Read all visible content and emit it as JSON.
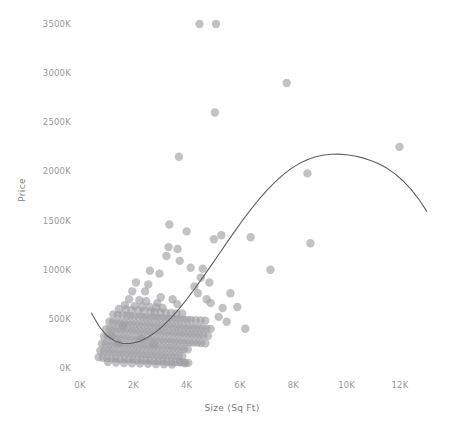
{
  "chart_data": {
    "type": "scatter",
    "title": "",
    "xlabel": "Size (Sq Ft)",
    "ylabel": "Price",
    "grid": false,
    "legend": false,
    "legend_position": "none",
    "xlim": [
      0,
      13000
    ],
    "ylim": [
      0,
      3650
    ],
    "x_ticks": [
      0,
      2000,
      4000,
      6000,
      8000,
      10000,
      12000
    ],
    "x_tick_labels": [
      "0K",
      "2K",
      "4K",
      "6K",
      "8K",
      "10K",
      "12K"
    ],
    "y_ticks": [
      0,
      500,
      1000,
      1500,
      2000,
      2500,
      3000,
      3500
    ],
    "y_tick_labels": [
      "0K",
      "500K",
      "1000K",
      "1500K",
      "2000K",
      "2500K",
      "3000K",
      "3500K"
    ],
    "y_units": "thousands",
    "marker": {
      "shape": "circle",
      "radius_px": 4.2,
      "color": "#9c9ca2",
      "opacity": 0.62
    },
    "trendline": {
      "present": true,
      "color": "#5f5f63",
      "width_px": 1.1,
      "style": "solid",
      "shape": "cubic-polynomial",
      "points": [
        [
          430,
          560
        ],
        [
          700,
          430
        ],
        [
          1000,
          330
        ],
        [
          1300,
          275
        ],
        [
          1600,
          250
        ],
        [
          1900,
          250
        ],
        [
          2200,
          268
        ],
        [
          2500,
          305
        ],
        [
          2800,
          358
        ],
        [
          3100,
          425
        ],
        [
          3400,
          505
        ],
        [
          3700,
          597
        ],
        [
          4000,
          698
        ],
        [
          4300,
          806
        ],
        [
          4600,
          920
        ],
        [
          4900,
          1037
        ],
        [
          5200,
          1155
        ],
        [
          5500,
          1273
        ],
        [
          5800,
          1390
        ],
        [
          6100,
          1503
        ],
        [
          6400,
          1611
        ],
        [
          6700,
          1712
        ],
        [
          7000,
          1805
        ],
        [
          7300,
          1889
        ],
        [
          7600,
          1963
        ],
        [
          7900,
          2026
        ],
        [
          8200,
          2077
        ],
        [
          8500,
          2117
        ],
        [
          8800,
          2146
        ],
        [
          9100,
          2165
        ],
        [
          9400,
          2175
        ],
        [
          9700,
          2176
        ],
        [
          10000,
          2170
        ],
        [
          10300,
          2157
        ],
        [
          10600,
          2138
        ],
        [
          10900,
          2112
        ],
        [
          11200,
          2078
        ],
        [
          11500,
          2034
        ],
        [
          11800,
          1978
        ],
        [
          12100,
          1908
        ],
        [
          12400,
          1822
        ],
        [
          12700,
          1719
        ],
        [
          13000,
          1596
        ]
      ]
    },
    "series": [
      {
        "name": "Homes",
        "points": [
          [
            4480,
            3500
          ],
          [
            5100,
            3500
          ],
          [
            7750,
            2900
          ],
          [
            5060,
            2600
          ],
          [
            3710,
            2150
          ],
          [
            8530,
            1980
          ],
          [
            11980,
            2250
          ],
          [
            8640,
            1270
          ],
          [
            3350,
            1460
          ],
          [
            4000,
            1390
          ],
          [
            5300,
            1350
          ],
          [
            3320,
            1230
          ],
          [
            3660,
            1210
          ],
          [
            3240,
            1140
          ],
          [
            3740,
            1090
          ],
          [
            7140,
            1000
          ],
          [
            4530,
            920
          ],
          [
            4850,
            870
          ],
          [
            4290,
            830
          ],
          [
            2100,
            870
          ],
          [
            2560,
            850
          ],
          [
            1960,
            780
          ],
          [
            5640,
            760
          ],
          [
            1840,
            700
          ],
          [
            2230,
            690
          ],
          [
            2480,
            680
          ],
          [
            3030,
            720
          ],
          [
            3470,
            700
          ],
          [
            2900,
            660
          ],
          [
            3650,
            650
          ],
          [
            1680,
            640
          ],
          [
            2050,
            630
          ],
          [
            2340,
            625
          ],
          [
            2620,
            620
          ],
          [
            2870,
            615
          ],
          [
            3100,
            610
          ],
          [
            1460,
            600
          ],
          [
            1720,
            595
          ],
          [
            1930,
            590
          ],
          [
            2180,
            585
          ],
          [
            2400,
            580
          ],
          [
            2650,
            575
          ],
          [
            2810,
            570
          ],
          [
            3010,
            565
          ],
          [
            3220,
            560
          ],
          [
            3420,
            560
          ],
          [
            3620,
            555
          ],
          [
            3830,
            555
          ],
          [
            1250,
            545
          ],
          [
            1420,
            540
          ],
          [
            1590,
            535
          ],
          [
            1760,
            530
          ],
          [
            1890,
            528
          ],
          [
            2040,
            525
          ],
          [
            2190,
            520
          ],
          [
            2330,
            518
          ],
          [
            2470,
            515
          ],
          [
            2610,
            512
          ],
          [
            2750,
            510
          ],
          [
            2890,
            508
          ],
          [
            3030,
            505
          ],
          [
            3180,
            503
          ],
          [
            3320,
            500
          ],
          [
            3460,
            498
          ],
          [
            3600,
            496
          ],
          [
            3740,
            494
          ],
          [
            3880,
            492
          ],
          [
            4020,
            490
          ],
          [
            4160,
            488
          ],
          [
            4340,
            486
          ],
          [
            4520,
            484
          ],
          [
            4700,
            482
          ],
          [
            1100,
            470
          ],
          [
            1240,
            465
          ],
          [
            1380,
            462
          ],
          [
            1520,
            458
          ],
          [
            1660,
            455
          ],
          [
            1800,
            452
          ],
          [
            1940,
            450
          ],
          [
            2080,
            447
          ],
          [
            2220,
            444
          ],
          [
            2360,
            442
          ],
          [
            2500,
            440
          ],
          [
            2640,
            437
          ],
          [
            2780,
            434
          ],
          [
            2920,
            432
          ],
          [
            3060,
            430
          ],
          [
            3200,
            428
          ],
          [
            3340,
            425
          ],
          [
            3480,
            422
          ],
          [
            3620,
            420
          ],
          [
            3760,
            418
          ],
          [
            3900,
            415
          ],
          [
            4040,
            412
          ],
          [
            4180,
            410
          ],
          [
            4320,
            408
          ],
          [
            4460,
            405
          ],
          [
            4600,
            402
          ],
          [
            4740,
            400
          ],
          [
            4900,
            398
          ],
          [
            980,
            395
          ],
          [
            1120,
            392
          ],
          [
            1260,
            390
          ],
          [
            1400,
            388
          ],
          [
            1540,
            385
          ],
          [
            1680,
            382
          ],
          [
            1820,
            380
          ],
          [
            1960,
            378
          ],
          [
            2100,
            375
          ],
          [
            2240,
            372
          ],
          [
            2380,
            370
          ],
          [
            2520,
            368
          ],
          [
            2660,
            365
          ],
          [
            2800,
            362
          ],
          [
            2940,
            360
          ],
          [
            3080,
            358
          ],
          [
            3220,
            355
          ],
          [
            3360,
            352
          ],
          [
            3500,
            350
          ],
          [
            3640,
            348
          ],
          [
            3780,
            345
          ],
          [
            3920,
            342
          ],
          [
            4060,
            340
          ],
          [
            4200,
            338
          ],
          [
            4340,
            335
          ],
          [
            4480,
            332
          ],
          [
            4620,
            330
          ],
          [
            4800,
            328
          ],
          [
            900,
            320
          ],
          [
            1040,
            318
          ],
          [
            1180,
            315
          ],
          [
            1320,
            312
          ],
          [
            1460,
            310
          ],
          [
            1600,
            308
          ],
          [
            1740,
            305
          ],
          [
            1880,
            302
          ],
          [
            2020,
            300
          ],
          [
            2160,
            298
          ],
          [
            2300,
            295
          ],
          [
            2440,
            292
          ],
          [
            2580,
            290
          ],
          [
            2720,
            288
          ],
          [
            2860,
            285
          ],
          [
            3000,
            282
          ],
          [
            3140,
            280
          ],
          [
            3280,
            278
          ],
          [
            3420,
            275
          ],
          [
            3560,
            272
          ],
          [
            3700,
            270
          ],
          [
            3840,
            268
          ],
          [
            3980,
            265
          ],
          [
            4120,
            262
          ],
          [
            4260,
            260
          ],
          [
            4400,
            258
          ],
          [
            4540,
            255
          ],
          [
            4700,
            252
          ],
          [
            820,
            248
          ],
          [
            960,
            245
          ],
          [
            1100,
            242
          ],
          [
            1240,
            240
          ],
          [
            1380,
            238
          ],
          [
            1520,
            235
          ],
          [
            1660,
            232
          ],
          [
            1800,
            230
          ],
          [
            1940,
            228
          ],
          [
            2080,
            225
          ],
          [
            2220,
            222
          ],
          [
            2360,
            220
          ],
          [
            2500,
            218
          ],
          [
            2640,
            215
          ],
          [
            2780,
            212
          ],
          [
            2920,
            210
          ],
          [
            3060,
            208
          ],
          [
            3200,
            205
          ],
          [
            3340,
            202
          ],
          [
            3480,
            200
          ],
          [
            3620,
            198
          ],
          [
            3760,
            195
          ],
          [
            3900,
            192
          ],
          [
            4040,
            190
          ],
          [
            760,
            175
          ],
          [
            900,
            172
          ],
          [
            1040,
            170
          ],
          [
            1180,
            168
          ],
          [
            1320,
            165
          ],
          [
            1460,
            162
          ],
          [
            1600,
            160
          ],
          [
            1740,
            158
          ],
          [
            1880,
            155
          ],
          [
            2020,
            152
          ],
          [
            2160,
            150
          ],
          [
            2300,
            148
          ],
          [
            2440,
            145
          ],
          [
            2580,
            142
          ],
          [
            2720,
            140
          ],
          [
            2860,
            138
          ],
          [
            3000,
            135
          ],
          [
            3140,
            132
          ],
          [
            3280,
            130
          ],
          [
            3420,
            128
          ],
          [
            3560,
            125
          ],
          [
            3700,
            122
          ],
          [
            3840,
            120
          ],
          [
            700,
            110
          ],
          [
            860,
            105
          ],
          [
            1020,
            100
          ],
          [
            1180,
            98
          ],
          [
            1340,
            95
          ],
          [
            1500,
            92
          ],
          [
            1660,
            90
          ],
          [
            1820,
            88
          ],
          [
            1980,
            85
          ],
          [
            2140,
            82
          ],
          [
            2300,
            80
          ],
          [
            2460,
            78
          ],
          [
            2620,
            75
          ],
          [
            2780,
            72
          ],
          [
            2940,
            70
          ],
          [
            3100,
            68
          ],
          [
            3260,
            65
          ],
          [
            3420,
            62
          ],
          [
            3580,
            60
          ],
          [
            3740,
            58
          ],
          [
            3900,
            55
          ],
          [
            4060,
            52
          ],
          [
            1050,
            60
          ],
          [
            1350,
            55
          ],
          [
            1650,
            50
          ],
          [
            1950,
            48
          ],
          [
            2250,
            45
          ],
          [
            2550,
            42
          ],
          [
            2850,
            40
          ],
          [
            3150,
            38
          ],
          [
            3450,
            36
          ],
          [
            3750,
            60
          ],
          [
            3950,
            48
          ],
          [
            5200,
            520
          ],
          [
            5500,
            470
          ],
          [
            5900,
            620
          ],
          [
            6200,
            400
          ],
          [
            4900,
            660
          ],
          [
            5350,
            610
          ],
          [
            4600,
            1010
          ],
          [
            4150,
            1020
          ],
          [
            2620,
            990
          ],
          [
            2980,
            960
          ],
          [
            2440,
            780
          ],
          [
            1620,
            430
          ],
          [
            6400,
            1330
          ],
          [
            5020,
            1310
          ],
          [
            4420,
            760
          ],
          [
            4750,
            700
          ],
          [
            2320,
            300
          ],
          [
            2760,
            240
          ],
          [
            1180,
            330
          ],
          [
            1460,
            250
          ]
        ]
      }
    ]
  },
  "axes": {
    "y_title": "Price",
    "x_title": "Size (Sq Ft)"
  },
  "colors": {
    "marker": "#9c9ca2",
    "trendline": "#5f5f63",
    "tick_text": "#9a9a9a",
    "axis_title_text": "#7a7a7a",
    "background": "#ffffff"
  }
}
